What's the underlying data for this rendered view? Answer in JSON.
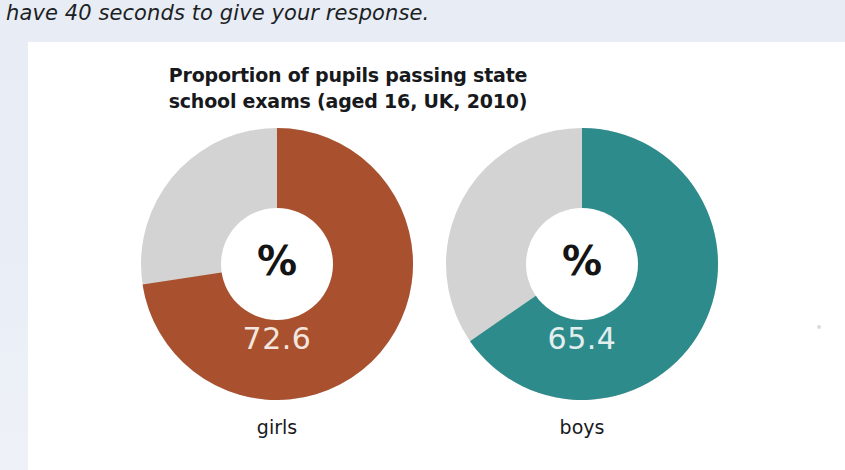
{
  "page": {
    "running_text": "have 40 seconds to give your response."
  },
  "figure": {
    "title_line1": "Proportion of pupils passing state",
    "title_line2": "school exams (aged 16, UK, 2010)",
    "center_symbol": "%",
    "colors": {
      "girls": "#a9512e",
      "boys": "#2e8b8b",
      "remainder": "#d3d3d3",
      "hole": "#ffffff",
      "value_label": "#f3e6df"
    },
    "donuts": [
      {
        "caption": "girls",
        "value_label": "72.6",
        "center_symbol": "%",
        "color": "#a9512e"
      },
      {
        "caption": "boys",
        "value_label": "65.4",
        "center_symbol": "%",
        "color": "#2e8b8b"
      }
    ]
  },
  "chart_data": {
    "type": "pie",
    "title": "Proportion of pupils passing state school exams (aged 16, UK, 2010)",
    "subtitle": "",
    "xlabel": "",
    "ylabel": "",
    "unit": "%",
    "legend": "none",
    "grid": false,
    "charts": [
      {
        "name": "girls",
        "type": "pie",
        "variant": "donut",
        "labels": [
          "passing",
          "not passing"
        ],
        "values": [
          72.6,
          27.4
        ],
        "colors": [
          "#a9512e",
          "#d3d3d3"
        ],
        "displayed_value": "72.6",
        "start_angle_deg": 0,
        "direction": "clockwise",
        "inner_radius_ratio": 0.41
      },
      {
        "name": "boys",
        "type": "pie",
        "variant": "donut",
        "labels": [
          "passing",
          "not passing"
        ],
        "values": [
          65.4,
          34.6
        ],
        "colors": [
          "#2e8b8b",
          "#d3d3d3"
        ],
        "displayed_value": "65.4",
        "start_angle_deg": 0,
        "direction": "clockwise",
        "inner_radius_ratio": 0.41
      }
    ]
  }
}
